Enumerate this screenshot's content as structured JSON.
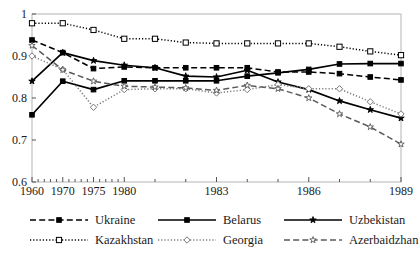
{
  "chart_data": {
    "type": "line",
    "title": "",
    "subtitle": "",
    "xlabel": "",
    "ylabel": "",
    "ylim": [
      0.6,
      1.0
    ],
    "ytick_labels": [
      "1",
      "0.9",
      "0.8",
      "0.7",
      "0.6"
    ],
    "ytick_values": [
      1.0,
      0.9,
      0.8,
      0.7,
      0.6
    ],
    "xtick_labels": [
      "1960",
      "1970",
      "1975",
      "1980",
      "1983",
      "1986",
      "1989"
    ],
    "xtick_values": [
      1960,
      1970,
      1975,
      1980,
      1983,
      1986,
      1989
    ],
    "x_axis_note": "non-linear ordinal axis: 1960, 1970, 1975 then yearly 1980-1989",
    "x_positions": [
      1960,
      1970,
      1975,
      1980,
      1981,
      1982,
      1983,
      1984,
      1985,
      1986,
      1987,
      1988,
      1989
    ],
    "grid": false,
    "legend_position": "below",
    "series": [
      {
        "name": "Ukraine",
        "style": "dashed",
        "marker": "filled-square",
        "color": "#000000",
        "x": [
          1960,
          1970,
          1975,
          1980,
          1981,
          1982,
          1983,
          1984,
          1985,
          1986,
          1987,
          1988,
          1989
        ],
        "values": [
          0.938,
          0.908,
          0.87,
          0.874,
          0.872,
          0.872,
          0.872,
          0.872,
          0.862,
          0.862,
          0.858,
          0.85,
          0.843
        ]
      },
      {
        "name": "Belarus",
        "style": "solid",
        "marker": "filled-square",
        "color": "#000000",
        "x": [
          1960,
          1970,
          1975,
          1980,
          1981,
          1982,
          1983,
          1984,
          1985,
          1986,
          1987,
          1988,
          1989
        ],
        "values": [
          0.76,
          0.84,
          0.82,
          0.841,
          0.841,
          0.841,
          0.841,
          0.852,
          0.86,
          0.868,
          0.881,
          0.882,
          0.882
        ]
      },
      {
        "name": "Uzbekistan",
        "style": "solid",
        "marker": "star-filled",
        "color": "#000000",
        "x": [
          1960,
          1970,
          1975,
          1980,
          1981,
          1982,
          1983,
          1984,
          1985,
          1986,
          1987,
          1988,
          1989
        ],
        "values": [
          0.84,
          0.908,
          0.889,
          0.878,
          0.872,
          0.852,
          0.85,
          0.866,
          0.838,
          0.82,
          0.793,
          0.772,
          0.752
        ]
      },
      {
        "name": "Kazakhstan",
        "style": "dotted",
        "marker": "open-square",
        "color": "#000000",
        "x": [
          1960,
          1970,
          1975,
          1980,
          1981,
          1982,
          1983,
          1984,
          1985,
          1986,
          1987,
          1988,
          1989
        ],
        "values": [
          0.978,
          0.978,
          0.962,
          0.941,
          0.941,
          0.932,
          0.93,
          0.93,
          0.93,
          0.93,
          0.922,
          0.911,
          0.902
        ]
      },
      {
        "name": "Georgia",
        "style": "dotted",
        "marker": "open-diamond",
        "color": "#7a7a7a",
        "x": [
          1960,
          1970,
          1975,
          1980,
          1981,
          1982,
          1983,
          1984,
          1985,
          1986,
          1987,
          1988,
          1989
        ],
        "values": [
          0.9,
          0.868,
          0.778,
          0.82,
          0.822,
          0.822,
          0.812,
          0.82,
          0.832,
          0.822,
          0.822,
          0.791,
          0.762
        ]
      },
      {
        "name": "Azerbaidzhan",
        "style": "dashed",
        "marker": "open-star",
        "color": "#5a5a5a",
        "x": [
          1960,
          1970,
          1975,
          1980,
          1981,
          1982,
          1983,
          1984,
          1985,
          1986,
          1987,
          1988,
          1989
        ],
        "values": [
          0.925,
          0.867,
          0.84,
          0.828,
          0.826,
          0.824,
          0.818,
          0.83,
          0.822,
          0.8,
          0.762,
          0.731,
          0.69
        ]
      }
    ]
  },
  "legend": {
    "items": [
      {
        "label": "Ukraine"
      },
      {
        "label": "Belarus"
      },
      {
        "label": "Uzbekistan"
      },
      {
        "label": "Kazakhstan"
      },
      {
        "label": "Georgia"
      },
      {
        "label": "Azerbaidzhan"
      }
    ]
  }
}
